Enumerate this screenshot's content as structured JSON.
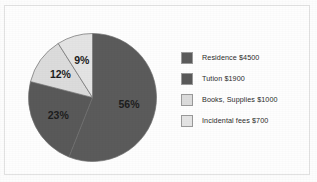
{
  "figure": {
    "background_color": "#fefefe",
    "frame_color": "#e2e2e2"
  },
  "chart_data": {
    "type": "pie",
    "title": "",
    "categories": [
      "Residence",
      "Tution",
      "Books, Supplies",
      "Incidental fees"
    ],
    "values": [
      4500,
      1900,
      1000,
      700
    ],
    "percentages": [
      56,
      23,
      12,
      9
    ],
    "data_labels": [
      "56%",
      "23%",
      "12%",
      "9%"
    ],
    "colors": [
      "#5b5b5b",
      "#595959",
      "#dcdcdc",
      "#e4e4e4"
    ],
    "legend_position": "right",
    "start_angle_deg": 0,
    "direction": "clockwise",
    "slices": [
      {
        "label": "56%",
        "percent": 56,
        "color": "#5b5b5b",
        "label_color": "#e9e9e9",
        "legend": "Residence $4500"
      },
      {
        "label": "23%",
        "percent": 23,
        "color": "#595959",
        "label_color": "#e9e9e9",
        "legend": "Tution $1900"
      },
      {
        "label": "12%",
        "percent": 12,
        "color": "#dcdcdc",
        "label_color": "#1d1d1d",
        "legend": "Books, Supplies $1000"
      },
      {
        "label": "9%",
        "percent": 9,
        "color": "#e4e4e4",
        "label_color": "#1d1d1d",
        "legend": "Incidental fees $700"
      }
    ]
  },
  "legend": {
    "items": [
      {
        "label": "Residence $4500",
        "color": "#5b5b5b"
      },
      {
        "label": "Tution $1900",
        "color": "#595959"
      },
      {
        "label": "Books, Supplies $1000",
        "color": "#dcdcdc"
      },
      {
        "label": "Incidental fees $700",
        "color": "#e4e4e4"
      }
    ]
  }
}
